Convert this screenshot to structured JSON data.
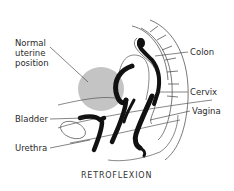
{
  "diagram": {
    "title": "RETROFLEXION",
    "labels": {
      "normal_position": [
        "Normal",
        "uterine",
        "position"
      ],
      "colon": "Colon",
      "cervix": "Cervix",
      "vagina": "Vagina",
      "bladder": "Bladder",
      "urethra": "Urethra"
    },
    "colors": {
      "organ_fill": "#111111",
      "normal_uterus_fill": "#c4c4c4",
      "outline": "#555555",
      "text": "#2b2b2b"
    }
  }
}
